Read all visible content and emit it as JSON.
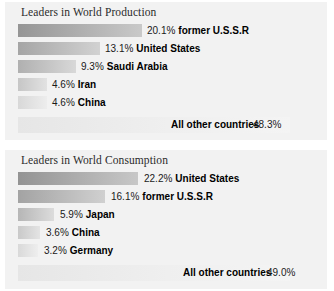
{
  "chart_data": [
    {
      "type": "bar",
      "title": "Leaders in World Production",
      "orientation": "horizontal",
      "xlabel": "",
      "ylabel": "",
      "grid": false,
      "legend": "none",
      "categories": [
        "former U.S.S.R",
        "United States",
        "Saudi Arabia",
        "Iran",
        "China",
        "All other countries"
      ],
      "values": [
        20.1,
        13.1,
        9.3,
        4.6,
        4.6,
        48.3
      ],
      "value_labels": [
        "20.1%",
        "13.1%",
        "9.3%",
        "4.6%",
        "4.6%",
        "48.3%"
      ],
      "rows": [
        {
          "pct": "20.1%",
          "name": "former U.S.S.R",
          "value": 20.1,
          "bar_width": 124,
          "label_left": 142,
          "bar_from": "#959595",
          "bar_to": "#c9c9c9"
        },
        {
          "pct": "13.1%",
          "name": "United States",
          "value": 13.1,
          "bar_width": 82,
          "label_left": 100,
          "bar_from": "#a5a5a5",
          "bar_to": "#d2d2d2"
        },
        {
          "pct": "9.3%",
          "name": "Saudi Arabia",
          "value": 9.3,
          "bar_width": 58,
          "label_left": 76,
          "bar_from": "#b0b0b0",
          "bar_to": "#d8d8d8"
        },
        {
          "pct": "4.6%",
          "name": "Iran",
          "value": 4.6,
          "bar_width": 29,
          "label_left": 47,
          "bar_from": "#c6c6c6",
          "bar_to": "#e2e2e2"
        },
        {
          "pct": "4.6%",
          "name": "China",
          "value": 4.6,
          "bar_width": 29,
          "label_left": 47,
          "bar_from": "#d8d8d8",
          "bar_to": "#ededed"
        }
      ],
      "other": {
        "pct": "48.3%",
        "name": "All other countries",
        "value": 48.3,
        "label_left": 166,
        "pct_left": 248
      }
    },
    {
      "type": "bar",
      "title": "Leaders in World Consumption",
      "orientation": "horizontal",
      "xlabel": "",
      "ylabel": "",
      "grid": false,
      "legend": "none",
      "categories": [
        "United States",
        "former U.S.S.R",
        "Japan",
        "China",
        "Germany",
        "All other countries"
      ],
      "values": [
        22.2,
        16.1,
        5.9,
        3.6,
        3.2,
        49.0
      ],
      "value_labels": [
        "22.2%",
        "16.1%",
        "5.9%",
        "3.6%",
        "3.2%",
        "49.0%"
      ],
      "rows": [
        {
          "pct": "22.2%",
          "name": "United States",
          "value": 22.2,
          "bar_width": 120,
          "label_left": 139,
          "bar_from": "#939393",
          "bar_to": "#c7c7c7"
        },
        {
          "pct": "16.1%",
          "name": "former U.S.S.R",
          "value": 16.1,
          "bar_width": 87,
          "label_left": 106,
          "bar_from": "#a3a3a3",
          "bar_to": "#d0d0d0"
        },
        {
          "pct": "5.9%",
          "name": "Japan",
          "value": 5.9,
          "bar_width": 36,
          "label_left": 55,
          "bar_from": "#b6b6b6",
          "bar_to": "#dcdcdc"
        },
        {
          "pct": "3.6%",
          "name": "China",
          "value": 3.6,
          "bar_width": 22,
          "label_left": 41,
          "bar_from": "#c9c9c9",
          "bar_to": "#e4e4e4"
        },
        {
          "pct": "3.2%",
          "name": "Germany",
          "value": 3.2,
          "bar_width": 20,
          "label_left": 39,
          "bar_from": "#d9d9d9",
          "bar_to": "#eeeeee"
        }
      ],
      "other": {
        "pct": "49.0%",
        "name": "All other countries",
        "value": 49.0,
        "label_left": 178,
        "pct_left": 262
      }
    }
  ]
}
